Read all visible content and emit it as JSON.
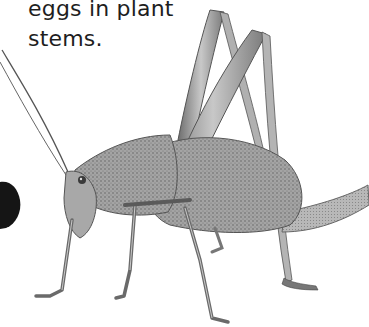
{
  "caption": {
    "line1": "eggs in plant",
    "line2": "stems."
  },
  "illustration": {
    "subject": "katydid / bush cricket",
    "style": "grayscale stippled drawing",
    "colors": {
      "body": "#9a9a9a",
      "body_dark": "#6e6e6e",
      "outline": "#4a4a4a",
      "background": "#ffffff",
      "dark_blob": "#151515"
    }
  }
}
